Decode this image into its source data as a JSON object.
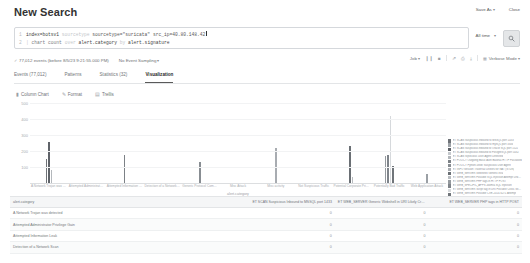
{
  "header": {
    "title": "New Search",
    "save_as": "Save As",
    "close": "Close"
  },
  "search": {
    "line1_gutter": "1",
    "line2_gutter": "2",
    "line1_cmd": "index=botsv1",
    "line1_dim": "sourcetype",
    "line1_str": "sourcetype=\"suricata\"",
    "line1_tail": "src_ip=40.80.148.42",
    "line2_pipe": "|",
    "line2_cmd": "chart count",
    "line2_kw": "over",
    "line2_field1": "alert.category",
    "line2_by": "by",
    "line2_field2": "alert.signature",
    "time_range": "All time",
    "search_icon": "search-icon"
  },
  "meta": {
    "events": "77,012 events (before 8/5/23 9:21:55.000 PM)",
    "sampling": "No Event Sampling",
    "job": "Job",
    "mode": "Verbose Mode",
    "icons": [
      "pause-icon",
      "stop-icon",
      "share-icon",
      "print-icon",
      "export-icon",
      "smart-mode-icon"
    ]
  },
  "tabs": [
    {
      "label": "Events (77,012)",
      "active": false
    },
    {
      "label": "Patterns",
      "active": false
    },
    {
      "label": "Statistics (32)",
      "active": false
    },
    {
      "label": "Visualization",
      "active": true
    }
  ],
  "viz_tools": [
    {
      "label": "Column Chart",
      "icon": "bar-chart-icon"
    },
    {
      "label": "Format",
      "icon": "brush-icon"
    },
    {
      "label": "Trellis",
      "icon": "grid-icon"
    }
  ],
  "chart_data": {
    "type": "bar",
    "title": "",
    "xlabel": "alert.category",
    "ylabel": "",
    "ylim": [
      0,
      500
    ],
    "yticks": [
      500,
      400,
      300,
      200,
      100
    ],
    "grid": true,
    "legend_position": "right",
    "categories": [
      "A Network Trojan was detected",
      "Attempted Administrator Privilege Gain",
      "Attempted Information Leak",
      "Detection of a Network Scan",
      "Generic Protocol Command Decode",
      "Misc Attack",
      "Misc activity",
      "Not Suspicious Traffic",
      "Potential Corporate Privacy Violation",
      "Potentially Bad Traffic",
      "Web Application Attack"
    ],
    "series": [
      {
        "name": "ET SCAN Suspicious Inbound to MSSQL port 1433",
        "color": "#6e7277",
        "values": [
          150,
          0,
          0,
          0,
          0,
          0,
          0,
          0,
          0,
          0,
          0
        ]
      },
      {
        "name": "ET SCAN Suspicious Inbound to mySQL port 3306",
        "color": "#9da2a7",
        "values": [
          0,
          0,
          0,
          0,
          0,
          0,
          0,
          0,
          0,
          0,
          0
        ]
      },
      {
        "name": "ET SCAN Suspicious inbound to Oracle SQL port 1521",
        "color": "#5f6369",
        "values": [
          255,
          0,
          0,
          0,
          0,
          0,
          0,
          0,
          0,
          0,
          0
        ]
      },
      {
        "name": "ET SCAN Suspicious inbound to PostgreSQL port 5432",
        "color": "#c4c8cc",
        "values": [
          0,
          0,
          0,
          0,
          0,
          0,
          0,
          0,
          0,
          0,
          0
        ]
      },
      {
        "name": "ET SCAN Sipvicious User-Agent Detected",
        "color": "#b4b8bc",
        "values": [
          80,
          0,
          0,
          0,
          0,
          0,
          0,
          0,
          0,
          0,
          0
        ]
      },
      {
        "name": "ET POLICY Outgoing Basic Auth Base64 HTTP Password",
        "color": "#7c8186",
        "values": [
          0,
          0,
          175,
          0,
          0,
          0,
          0,
          0,
          0,
          0,
          0
        ]
      },
      {
        "name": "ET POLICY Python-urllib/ Suspicious User Agent",
        "color": "#888d92",
        "values": [
          0,
          0,
          0,
          0,
          130,
          0,
          0,
          0,
          0,
          0,
          0
        ]
      },
      {
        "name": "ET INFO Session Traversal Utilities for NAT (STUN)",
        "color": "#a8acb1",
        "values": [
          0,
          0,
          0,
          0,
          0,
          0,
          220,
          0,
          0,
          0,
          0
        ]
      },
      {
        "name": "ET WEB_SERVER WebShell Generic eval",
        "color": "#6a6f74",
        "values": [
          0,
          0,
          0,
          0,
          0,
          0,
          0,
          0,
          230,
          0,
          0
        ]
      },
      {
        "name": "ET WEB_SERVER Possible SQL Injection Attempt UNION SELECT",
        "color": "#b8bcc0",
        "values": [
          0,
          0,
          0,
          0,
          0,
          0,
          0,
          0,
          40,
          0,
          0
        ]
      },
      {
        "name": "ET WEB_SERVER PHP tags in HTTP POST",
        "color": "#959a9f",
        "values": [
          0,
          0,
          0,
          0,
          0,
          0,
          0,
          0,
          0,
          170,
          0
        ]
      },
      {
        "name": "ET WEB_SPECIFIC_APPS Joomla SQL Injection",
        "color": "#7f848a",
        "values": [
          0,
          0,
          0,
          0,
          0,
          0,
          0,
          0,
          0,
          175,
          0
        ]
      },
      {
        "name": "ET WEB_SERVER Script tag in URI Possible Cross Site Scripting",
        "color": "#d6d9dc",
        "values": [
          0,
          0,
          0,
          0,
          0,
          0,
          0,
          0,
          0,
          420,
          0
        ]
      },
      {
        "name": "ET WEB_SERVER Possible CVE-2014-6271 Attempt",
        "color": "#70757a",
        "values": [
          0,
          0,
          0,
          0,
          0,
          0,
          0,
          0,
          0,
          105,
          0
        ]
      },
      {
        "name": "OTHER",
        "color": "#9ba0a5",
        "values": [
          0,
          0,
          0,
          0,
          0,
          0,
          0,
          0,
          0,
          0,
          55
        ]
      }
    ]
  },
  "table": {
    "columns": [
      "alert.category",
      "ET SCAN Suspicious Inbound to MSSQL port 1433",
      "ET WEB_SERVER Generic Webshell in URI Likely Cross Site Scripting Attempt",
      "ET WEB_SERVER PHP tags in HTTP POST"
    ],
    "rows": [
      [
        "A Network Trojan was detected",
        "0",
        "0",
        "0"
      ],
      [
        "Attempted Administrator Privilege Gain",
        "0",
        "0",
        "0"
      ],
      [
        "Attempted Information Leak",
        "0",
        "0",
        "0"
      ],
      [
        "Detection of a Network Scan",
        "0",
        "0",
        "0"
      ]
    ]
  }
}
